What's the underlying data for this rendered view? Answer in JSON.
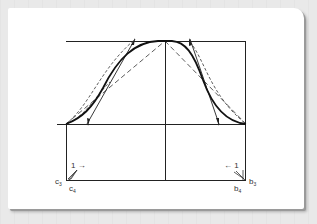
{
  "figure": {
    "type": "curve construction diagram",
    "colors": {
      "background": "#e9e9e9",
      "card": "#ffffff",
      "line": "#222222",
      "curve": "#111111"
    }
  },
  "labels": {
    "left_arrow": "1 →",
    "right_arrow": "← 1",
    "c3": "c",
    "c3_sub": "3",
    "c4": "c",
    "c4_sub": "4",
    "b3": "b",
    "b3_sub": "3",
    "b4": "b",
    "b4_sub": "4"
  }
}
